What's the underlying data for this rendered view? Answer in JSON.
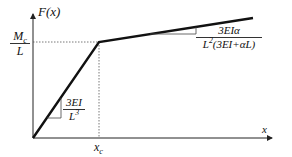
{
  "diagram": {
    "type": "bilinear force-displacement curve",
    "y_axis_label": "F(x)",
    "x_axis_label": "x",
    "y_tick": {
      "num": "M",
      "num_sub": "c",
      "den": "L"
    },
    "x_tick": {
      "main": "x",
      "sub": "c"
    },
    "slope1": {
      "num": "3EI",
      "den_main": "L",
      "den_sup": "3"
    },
    "slope2": {
      "num": "3EIα",
      "den": "L",
      "den_sup": "2",
      "den_rest": "(3EI+αL)"
    },
    "colors": {
      "line": "#111111",
      "axis": "#222222",
      "dotted": "#555555",
      "triangle": "#444444"
    }
  }
}
